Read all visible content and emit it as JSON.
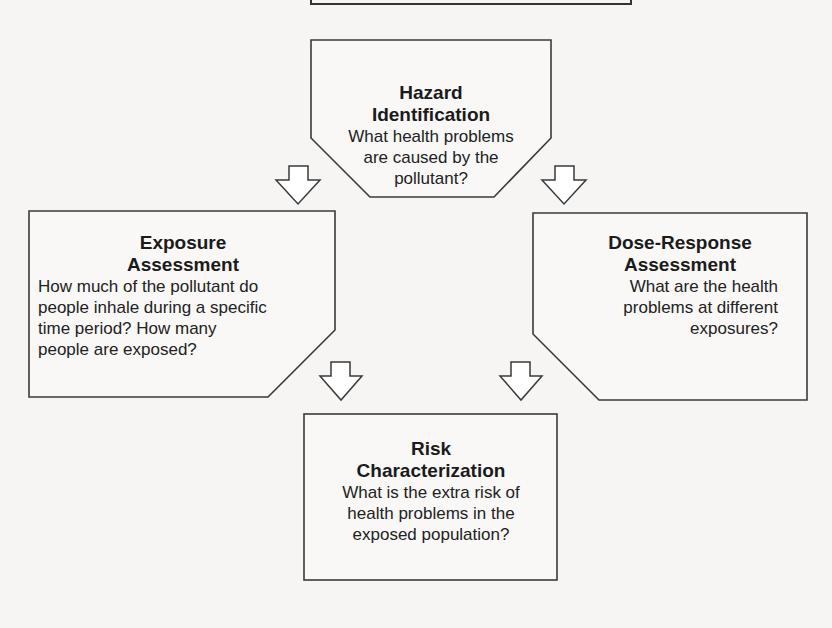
{
  "diagram": {
    "type": "flowchart",
    "nodes": [
      {
        "id": "hazard",
        "title_line1": "Hazard",
        "title_line2": "Identification",
        "desc_lines": [
          "What health problems",
          "are caused by the",
          "pollutant?"
        ]
      },
      {
        "id": "exposure",
        "title_line1": "Exposure",
        "title_line2": "Assessment",
        "desc_lines": [
          "How much of the pollutant do",
          "people inhale during a specific",
          "time period? How many",
          "people are exposed?"
        ]
      },
      {
        "id": "dose",
        "title_line1": "Dose-Response",
        "title_line2": "Assessment",
        "desc_lines": [
          "What are the health",
          "problems at different",
          "exposures?"
        ]
      },
      {
        "id": "risk",
        "title_line1": "Risk",
        "title_line2": "Characterization",
        "desc_lines": [
          "What is the extra risk of",
          "health problems in the",
          "exposed population?"
        ]
      }
    ],
    "edges": [
      {
        "from": "hazard",
        "to": "exposure"
      },
      {
        "from": "hazard",
        "to": "dose"
      },
      {
        "from": "exposure",
        "to": "risk"
      },
      {
        "from": "dose",
        "to": "risk"
      }
    ],
    "colors": {
      "stroke": "#3a3a3a",
      "fill": "#ffffff",
      "background": "#f6f5f3"
    }
  }
}
